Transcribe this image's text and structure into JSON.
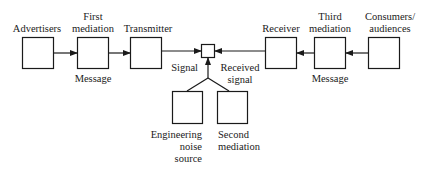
{
  "diagram": {
    "nodes": [
      {
        "id": "advertisers",
        "label": "Advertisers"
      },
      {
        "id": "first-mediation",
        "label_line1": "First",
        "label_line2": "mediation"
      },
      {
        "id": "transmitter",
        "label": "Transmitter"
      },
      {
        "id": "receiver",
        "label": "Receiver"
      },
      {
        "id": "third-mediation",
        "label_line1": "Third",
        "label_line2": "mediation"
      },
      {
        "id": "consumers",
        "label_line1": "Consumers/",
        "label_line2": "audiences"
      },
      {
        "id": "noise-source",
        "label_line1": "Engineering",
        "label_line2": "noise",
        "label_line3": "source"
      },
      {
        "id": "second-mediation",
        "label_line1": "Second",
        "label_line2": "mediation"
      }
    ],
    "edge_labels": {
      "message_left": "Message",
      "signal": "Signal",
      "received_signal_line1": "Received",
      "received_signal_line2": "signal",
      "message_right": "Message"
    },
    "colors": {
      "stroke": "#1a1a1a",
      "background": "#ffffff"
    }
  }
}
